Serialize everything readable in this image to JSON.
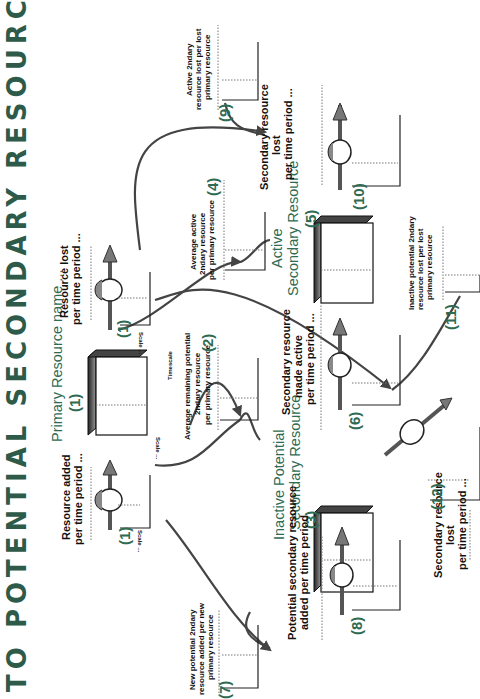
{
  "title": "TO POTENTIAL SECONDARY RESOURCE",
  "colors": {
    "title": "#2e5a4a",
    "accent_green": "#2e6b52",
    "flow_line": "#444444",
    "box_side": "#555555"
  },
  "stocks": {
    "primary": {
      "label": "Primary Resource name ...",
      "number": "(1)",
      "scale": "Scale ...",
      "timescale": "Timescale"
    },
    "inactive": {
      "line1": "Inactive Potential",
      "line2": "Secondary Resource",
      "number": "(3)"
    },
    "active": {
      "line1": "Active",
      "line2": "Secondary Resource",
      "number": "(5)"
    }
  },
  "flows": {
    "added": {
      "line1": "Resource added",
      "line2": "per time period ...",
      "number": "(1)",
      "scale": "Scale ..."
    },
    "lost": {
      "line1": "Resource lost",
      "line2": "per time period ...",
      "number": "(1)",
      "scale": "Scale ..."
    },
    "made_active": {
      "line1": "Secondary resource",
      "line2": "made active",
      "line3": "per time period ...",
      "number": "(6)"
    },
    "potential_added": {
      "line1": "Potential secondary resource",
      "line2": "added per time period",
      "number": "(8)"
    },
    "secondary_lost": {
      "line1": "Secondary resource",
      "line2": "lost",
      "line3": "per time period ...",
      "number": "(10)"
    },
    "inactive_lost": {
      "line1": "Secondary resource",
      "line2": "lost",
      "line3": "per time period ...",
      "number": "(12)"
    }
  },
  "converters": {
    "avg_remaining": {
      "line1": "Average remaining potential",
      "line2": "2ndary resource",
      "line3": "per primary resource",
      "number": "(2)"
    },
    "avg_active": {
      "line1": "Average active",
      "line2": "2ndary resource",
      "line3": "per primary resource",
      "number": "(4)"
    },
    "new_potential": {
      "line1": "New potential 2ndary",
      "line2": "resource added per new",
      "line3": "primary resource",
      "number": "(7)"
    },
    "active_lost": {
      "line1": "Active 2ndary",
      "line2": "resource lost per lost",
      "line3": "primary resource",
      "number": "(9)"
    },
    "inactive_lost_per": {
      "line1": "Inactive potential 2ndary",
      "line2": "resource lost per lost",
      "line3": "primary resource",
      "number": "(11)"
    }
  }
}
